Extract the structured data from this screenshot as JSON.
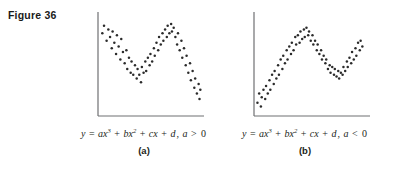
{
  "figure": {
    "label": "Figure 36"
  },
  "colors": {
    "background": "#ffffff",
    "axis": "#6f7072",
    "point": "#2b2b2b",
    "text": "#231f20"
  },
  "panels": [
    {
      "id": "a",
      "sublabel": "(a)",
      "equation": {
        "y": "y",
        "equals": "=",
        "term1_coef": "a",
        "term1_var": "x",
        "term1_exp": "3",
        "plus1": "+",
        "term2_coef": "b",
        "term2_var": "x",
        "term2_exp": "2",
        "plus2": "+",
        "term3_coef": "c",
        "term3_var": "x",
        "plus3": "+",
        "term4": "d",
        "comma": ",",
        "condition_var": "a",
        "condition_op": ">",
        "condition_val": "0",
        "full_text": "y = ax3 + bx2 + cx + d, a > 0"
      }
    },
    {
      "id": "b",
      "sublabel": "(b)",
      "equation": {
        "y": "y",
        "equals": "=",
        "term1_coef": "a",
        "term1_var": "x",
        "term1_exp": "3",
        "plus1": "+",
        "term2_coef": "b",
        "term2_var": "x",
        "term2_exp": "2",
        "plus2": "+",
        "term3_coef": "c",
        "term3_var": "x",
        "plus3": "+",
        "term4": "d",
        "comma": ",",
        "condition_var": "a",
        "condition_op": "<",
        "condition_val": "0",
        "full_text": "y = ax3 + bx2 + cx + d, a < 0"
      }
    }
  ],
  "chart_data": [
    {
      "type": "scatter",
      "id": "a",
      "title": "",
      "xlabel": "y = ax3 + bx2 + cx + d, a > 0",
      "ylabel": "",
      "grid": false,
      "legend": "none",
      "axes": {
        "origin": [
          14,
          108
        ],
        "y_axis_top": 4,
        "x_axis_right": 120,
        "xlim": [
          0,
          120
        ],
        "ylim": [
          0,
          108
        ]
      },
      "description": "Scatter cloud following a rising cubic with a local maximum then local minimum then steep rise; positive leading coefficient.",
      "points": [
        [
          5,
          88
        ],
        [
          7,
          96
        ],
        [
          10,
          80
        ],
        [
          12,
          92
        ],
        [
          14,
          84
        ],
        [
          16,
          72
        ],
        [
          17,
          90
        ],
        [
          19,
          78
        ],
        [
          21,
          66
        ],
        [
          22,
          86
        ],
        [
          24,
          74
        ],
        [
          26,
          60
        ],
        [
          27,
          82
        ],
        [
          29,
          68
        ],
        [
          31,
          56
        ],
        [
          33,
          70
        ],
        [
          34,
          50
        ],
        [
          36,
          62
        ],
        [
          38,
          46
        ],
        [
          39,
          58
        ],
        [
          41,
          44
        ],
        [
          43,
          54
        ],
        [
          45,
          40
        ],
        [
          46,
          50
        ],
        [
          48,
          44
        ],
        [
          50,
          36
        ],
        [
          51,
          52
        ],
        [
          53,
          46
        ],
        [
          55,
          58
        ],
        [
          56,
          48
        ],
        [
          58,
          62
        ],
        [
          60,
          54
        ],
        [
          61,
          66
        ],
        [
          63,
          58
        ],
        [
          65,
          72
        ],
        [
          66,
          64
        ],
        [
          68,
          78
        ],
        [
          70,
          70
        ],
        [
          71,
          84
        ],
        [
          73,
          76
        ],
        [
          75,
          88
        ],
        [
          76,
          80
        ],
        [
          78,
          92
        ],
        [
          80,
          84
        ],
        [
          81,
          96
        ],
        [
          83,
          88
        ],
        [
          85,
          98
        ],
        [
          86,
          90
        ],
        [
          88,
          94
        ],
        [
          90,
          84
        ],
        [
          92,
          76
        ],
        [
          93,
          88
        ],
        [
          95,
          70
        ],
        [
          97,
          80
        ],
        [
          98,
          62
        ],
        [
          100,
          72
        ],
        [
          102,
          54
        ],
        [
          103,
          64
        ],
        [
          105,
          46
        ],
        [
          107,
          56
        ],
        [
          108,
          38
        ],
        [
          110,
          48
        ],
        [
          112,
          30
        ],
        [
          113,
          40
        ],
        [
          115,
          24
        ],
        [
          117,
          34
        ],
        [
          118,
          18
        ],
        [
          119,
          28
        ]
      ]
    },
    {
      "type": "scatter",
      "id": "b",
      "title": "",
      "xlabel": "y = ax3 + bx2 + cx + d, a < 0",
      "ylabel": "",
      "grid": false,
      "legend": "none",
      "axes": {
        "origin": [
          14,
          108
        ],
        "y_axis_top": 4,
        "x_axis_right": 130,
        "xlim": [
          0,
          130
        ],
        "ylim": [
          0,
          108
        ]
      },
      "description": "Scatter cloud following a falling cubic: steep decline, local minimum, local maximum, then decline; negative leading coefficient.",
      "points": [
        [
          4,
          14
        ],
        [
          6,
          24
        ],
        [
          8,
          10
        ],
        [
          9,
          20
        ],
        [
          11,
          28
        ],
        [
          13,
          18
        ],
        [
          14,
          32
        ],
        [
          16,
          24
        ],
        [
          18,
          38
        ],
        [
          19,
          28
        ],
        [
          21,
          44
        ],
        [
          23,
          34
        ],
        [
          24,
          48
        ],
        [
          26,
          40
        ],
        [
          28,
          54
        ],
        [
          29,
          44
        ],
        [
          31,
          60
        ],
        [
          33,
          50
        ],
        [
          34,
          64
        ],
        [
          36,
          56
        ],
        [
          38,
          70
        ],
        [
          39,
          60
        ],
        [
          41,
          74
        ],
        [
          43,
          66
        ],
        [
          44,
          78
        ],
        [
          46,
          70
        ],
        [
          48,
          84
        ],
        [
          49,
          76
        ],
        [
          51,
          86
        ],
        [
          53,
          78
        ],
        [
          54,
          90
        ],
        [
          56,
          82
        ],
        [
          58,
          92
        ],
        [
          59,
          84
        ],
        [
          61,
          94
        ],
        [
          63,
          86
        ],
        [
          64,
          90
        ],
        [
          66,
          80
        ],
        [
          68,
          86
        ],
        [
          69,
          76
        ],
        [
          71,
          80
        ],
        [
          73,
          70
        ],
        [
          74,
          76
        ],
        [
          76,
          66
        ],
        [
          78,
          70
        ],
        [
          79,
          60
        ],
        [
          81,
          64
        ],
        [
          83,
          56
        ],
        [
          84,
          60
        ],
        [
          86,
          50
        ],
        [
          88,
          54
        ],
        [
          89,
          46
        ],
        [
          91,
          52
        ],
        [
          93,
          44
        ],
        [
          94,
          50
        ],
        [
          96,
          42
        ],
        [
          98,
          48
        ],
        [
          99,
          40
        ],
        [
          101,
          46
        ],
        [
          103,
          44
        ],
        [
          104,
          52
        ],
        [
          106,
          48
        ],
        [
          108,
          58
        ],
        [
          109,
          52
        ],
        [
          111,
          62
        ],
        [
          113,
          56
        ],
        [
          114,
          68
        ],
        [
          116,
          60
        ],
        [
          118,
          72
        ],
        [
          119,
          64
        ],
        [
          121,
          78
        ],
        [
          123,
          70
        ],
        [
          124,
          80
        ],
        [
          126,
          74
        ]
      ]
    }
  ]
}
